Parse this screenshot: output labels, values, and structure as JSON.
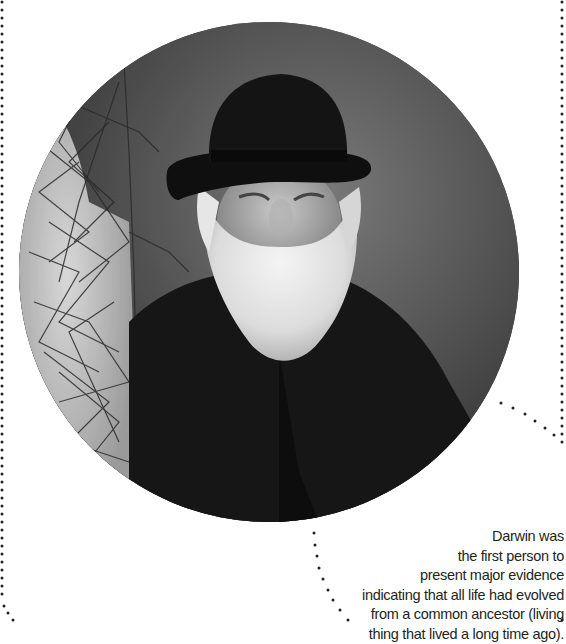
{
  "portrait": {
    "subject": "Charles Darwin",
    "style": "black-and-white photograph in circular crop",
    "elements": [
      "bowler hat",
      "white beard",
      "dark coat",
      "vine-covered tree trunk"
    ]
  },
  "caption": {
    "lines": [
      "Darwin was",
      "the first person to",
      "present major evidence",
      "indicating that all life had evolved",
      "from a common ancestor (living",
      "thing that lived a long time ago)."
    ]
  },
  "decoration": {
    "dot_color": "#231f20",
    "left_border": "dotted vertical line",
    "right_border": "dotted vertical line",
    "callout_pointers": [
      "dotted line from circle to right border",
      "dotted line toward bottom"
    ]
  }
}
